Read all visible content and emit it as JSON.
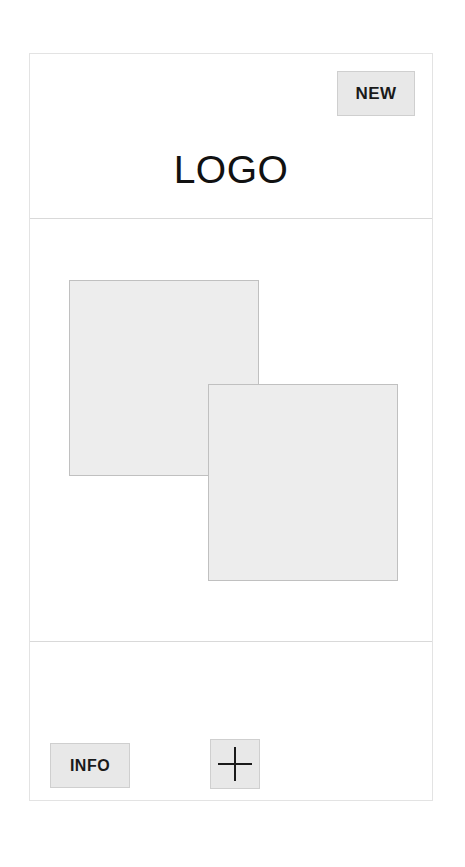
{
  "screen": {
    "kind": "mobile-app-wireframe",
    "background_color": "#ffffff",
    "frame_border_color": "#e3e3e3"
  },
  "header": {
    "logo_text": "LOGO",
    "divider_color": "#d9d9d9",
    "new_button": {
      "label": "NEW",
      "fill_color": "#e8e8e8",
      "border_color": "#cfcfcf"
    }
  },
  "content": {
    "divider_color": "#d9d9d9",
    "placeholders": [
      {
        "name": "placeholder-box-back",
        "fill_color": "#ededed",
        "border_color": "#c0c0c0",
        "label": ""
      },
      {
        "name": "placeholder-box-front",
        "fill_color": "#ededed",
        "border_color": "#c0c0c0",
        "label": ""
      }
    ]
  },
  "footer": {
    "info_button": {
      "label": "INFO",
      "fill_color": "#e8e8e8",
      "border_color": "#cfcfcf"
    },
    "add_button": {
      "icon": "plus-icon",
      "fill_color": "#e8e8e8",
      "border_color": "#cfcfcf"
    }
  }
}
